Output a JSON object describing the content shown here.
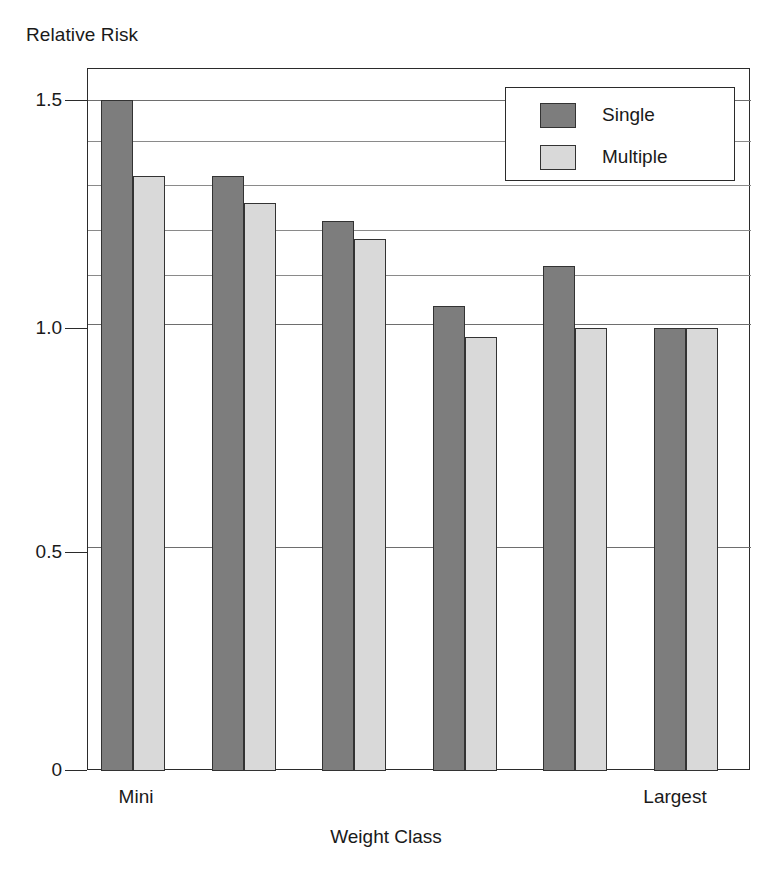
{
  "chart_data": {
    "type": "bar",
    "title": "",
    "ylabel": "Relative Risk",
    "xlabel": "Weight Class",
    "categories": [
      "Mini",
      "",
      "",
      "",
      "",
      "Largest"
    ],
    "category_axis_labels": {
      "first": "Mini",
      "last": "Largest"
    },
    "series": [
      {
        "name": "Single",
        "color": "#7d7d7d",
        "values": [
          1.5,
          1.33,
          1.23,
          1.04,
          1.13,
          0.99
        ]
      },
      {
        "name": "Multiple",
        "color": "#d9d9d9",
        "values": [
          1.33,
          1.27,
          1.19,
          0.97,
          0.99,
          0.99
        ]
      }
    ],
    "ylim": [
      0,
      1.57
    ],
    "y_tick_labels": [
      "1.5",
      "1.0",
      "0.5",
      "0"
    ],
    "y_tick_values": [
      1.5,
      1.0,
      0.5,
      0
    ],
    "gridlines_y": [
      1.5,
      1.41,
      1.31,
      1.21,
      1.11,
      1.0,
      0.5
    ],
    "grid": true,
    "legend_position": "top-right",
    "legend_entries": [
      "Single",
      "Multiple"
    ]
  },
  "axes": {
    "y_title": "Relative Risk",
    "x_title": "Weight Class"
  },
  "legend": {
    "items": [
      {
        "label": "Single"
      },
      {
        "label": "Multiple"
      }
    ]
  },
  "x_labels": {
    "left": "Mini",
    "right": "Largest"
  },
  "y_labels": {
    "t0": "1.5",
    "t1": "1.0",
    "t2": "0.5",
    "t3": "0"
  },
  "colors": {
    "single": "#7d7d7d",
    "multiple": "#d9d9d9",
    "frame": "#2b2b2b",
    "grid": "#8a8a8a",
    "background": "#ffffff"
  }
}
